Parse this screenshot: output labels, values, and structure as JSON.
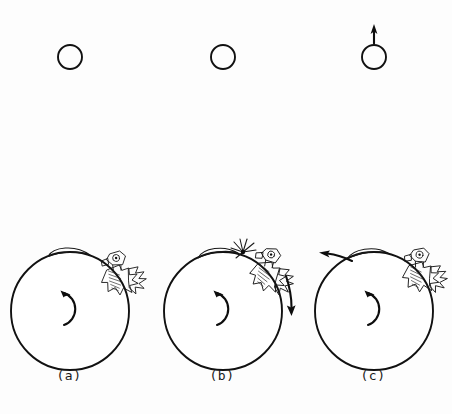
{
  "figure": {
    "background_color": "#fdfdfd",
    "ink_color": "#111111",
    "width": 452,
    "height": 414
  },
  "panels": [
    {
      "id": "a",
      "label": "(a)",
      "label_x": 69,
      "label_y": 375,
      "body": {
        "name": "main-body-circle",
        "cx": 70,
        "cy": 311,
        "r": 59
      },
      "rotation_indicator": {
        "name": "clockwise-rotation-arc",
        "direction": "clockwise",
        "cx": 70,
        "cy": 307,
        "r": 18
      },
      "polar_cap": {
        "name": "hatched-cap",
        "present": true,
        "angle_deg": -100,
        "span_deg": 34
      },
      "eruption": {
        "name": "spiky-eruption-cluster",
        "present": true,
        "angle_deg": -35,
        "scale": 1.0,
        "detached": false
      },
      "external_arrow": {
        "present": false,
        "label": ""
      },
      "small_circle": {
        "name": "ejected-fragment",
        "cx": 70,
        "cy": 57,
        "r": 12,
        "arrow": false
      }
    },
    {
      "id": "b",
      "label": "(b)",
      "label_x": 222,
      "label_y": 375,
      "body": {
        "name": "main-body-circle",
        "cx": 223,
        "cy": 311,
        "r": 59
      },
      "rotation_indicator": {
        "name": "clockwise-rotation-arc",
        "direction": "clockwise",
        "cx": 223,
        "cy": 307,
        "r": 18
      },
      "polar_cap": {
        "name": "hatched-cap",
        "present": true,
        "angle_deg": -104,
        "span_deg": 30
      },
      "eruption": {
        "name": "spiky-eruption-cluster",
        "present": true,
        "angle_deg": -52,
        "scale": 1.0,
        "detached": false
      },
      "burst": {
        "name": "starburst-impact-marker",
        "present": true,
        "cx": 242,
        "cy": 248,
        "rays": 7
      },
      "external_arrow": {
        "present": true,
        "name": "downward-motion-arrow",
        "direction": "down",
        "x1": 288,
        "y1": 276,
        "x2": 292,
        "y2": 315
      },
      "small_circle": {
        "name": "ejected-fragment",
        "cx": 223,
        "cy": 57,
        "r": 12,
        "arrow": false
      }
    },
    {
      "id": "c",
      "label": "(c)",
      "label_x": 373,
      "label_y": 375,
      "body": {
        "name": "main-body-circle",
        "cx": 374,
        "cy": 311,
        "r": 59
      },
      "rotation_indicator": {
        "name": "clockwise-rotation-arc",
        "direction": "clockwise",
        "cx": 374,
        "cy": 307,
        "r": 18
      },
      "polar_cap": {
        "name": "hatched-cap",
        "present": true,
        "angle_deg": -108,
        "span_deg": 28
      },
      "eruption": {
        "name": "spiky-eruption-cluster",
        "present": true,
        "angle_deg": -42,
        "scale": 1.0,
        "detached": false
      },
      "external_arrow": {
        "present": true,
        "name": "surface-recoil-arrow",
        "direction": "left",
        "x1": 350,
        "y1": 261,
        "x2": 322,
        "y2": 255
      },
      "small_circle": {
        "name": "ejected-fragment",
        "cx": 374,
        "cy": 57,
        "r": 12,
        "arrow": true,
        "arrow_name": "upward-ejection-arrow",
        "arrow_from_y": 43,
        "arrow_to_y": 25
      }
    }
  ]
}
